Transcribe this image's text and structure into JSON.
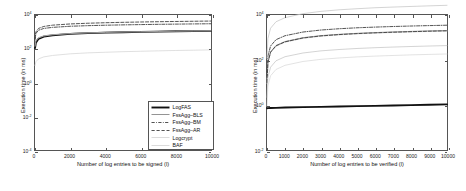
{
  "figure": {
    "panel_count": 2,
    "background": "#ffffff",
    "axis_color": "#555555"
  },
  "chart_data": [
    {
      "type": "line",
      "panel": "left",
      "title": "",
      "xlabel": "Number of log entries to be signed (l)",
      "ylabel": "Execution time (in ms)",
      "yscale": "log",
      "xscale": "linear",
      "xlim": [
        0,
        10000
      ],
      "ylim": [
        0.0001,
        10000
      ],
      "grid": false,
      "legend_position": "lower right",
      "xticks": [
        0,
        2000,
        4000,
        6000,
        8000,
        10000
      ],
      "xticklabels": [
        "0",
        "2000",
        "4000",
        "6000",
        "8000",
        "10000"
      ],
      "yticks": [
        10000,
        100,
        1,
        0.01,
        0.0001
      ],
      "yticklabels": [
        "10^4",
        "10^2",
        "10^0",
        "10^-2",
        "10^-4"
      ],
      "ytick_bases": [
        "10",
        "10",
        "10",
        "10",
        "10"
      ],
      "ytick_exponents": [
        "4",
        "2",
        "0",
        "-2",
        "-4"
      ],
      "x": [
        1,
        50,
        200,
        500,
        1000,
        2000,
        3000,
        4000,
        5000,
        6000,
        7000,
        8000,
        9000,
        10000
      ],
      "series": [
        {
          "name": "LogFAS",
          "style": "thick-solid",
          "color": "#111111",
          "width": 1.9,
          "values": [
            110,
            230,
            390,
            520,
            620,
            760,
            840,
            900,
            950,
            1000,
            1040,
            1080,
            1110,
            1150
          ]
        },
        {
          "name": "FssAgg-BLS",
          "style": "thin-solid",
          "color": "#666666",
          "width": 0.7,
          "values": [
            150,
            300,
            450,
            580,
            680,
            800,
            880,
            940,
            990,
            1030,
            1070,
            1110,
            1140,
            1180
          ]
        },
        {
          "name": "FssAgg-BM",
          "style": "dash-dot",
          "color": "#333333",
          "width": 0.85,
          "values": [
            330,
            800,
            1250,
            1600,
            1850,
            2150,
            2330,
            2480,
            2600,
            2700,
            2800,
            2880,
            2960,
            3030
          ]
        },
        {
          "name": "FssAgg-AR",
          "style": "dashed",
          "color": "#333333",
          "width": 0.85,
          "values": [
            400,
            1000,
            1600,
            2100,
            2500,
            2950,
            3250,
            3480,
            3680,
            3850,
            4000,
            4130,
            4260,
            4380
          ]
        },
        {
          "name": "Logcrypt",
          "style": "light-solid",
          "color": "#d2d2d2",
          "width": 0.7,
          "values": [
            10,
            17,
            25,
            33,
            40,
            50,
            57,
            62,
            67,
            71,
            75,
            79,
            82,
            86
          ]
        },
        {
          "name": "BAF",
          "style": "light-solid",
          "color": "#c8c8c8",
          "width": 0.7,
          "values": [
            140,
            290,
            440,
            570,
            670,
            790,
            870,
            930,
            980,
            1020,
            1060,
            1100,
            1130,
            1170
          ]
        }
      ]
    },
    {
      "type": "line",
      "panel": "right",
      "title": "",
      "xlabel": "Number of log entries to be verified (l)",
      "ylabel": "Execution time (in ms)",
      "yscale": "log",
      "xscale": "linear",
      "xlim": [
        0,
        10000
      ],
      "ylim": [
        0.01,
        10000
      ],
      "grid": false,
      "legend_position": "lower right",
      "xticks": [
        0,
        1000,
        2000,
        3000,
        4000,
        5000,
        6000,
        7000,
        8000,
        9000,
        10000
      ],
      "xticklabels": [
        "0",
        "1000",
        "2000",
        "3000",
        "4000",
        "5000",
        "6000",
        "7000",
        "8000",
        "9000",
        "10000"
      ],
      "yticks": [
        10000,
        100,
        1,
        0.01
      ],
      "yticklabels": [
        "10^4",
        "10^2",
        "10^0",
        "10^-2"
      ],
      "ytick_bases": [
        "10",
        "10",
        "10",
        "10"
      ],
      "ytick_exponents": [
        "4",
        "2",
        "0",
        "-2"
      ],
      "x": [
        1,
        50,
        200,
        500,
        1000,
        2000,
        3000,
        4000,
        5000,
        6000,
        7000,
        8000,
        9000,
        10000
      ],
      "series": [
        {
          "name": "LogFAS",
          "style": "thick-solid",
          "color": "#111111",
          "width": 1.9,
          "values": [
            0.72,
            0.73,
            0.74,
            0.75,
            0.77,
            0.8,
            0.83,
            0.86,
            0.89,
            0.92,
            0.95,
            0.99,
            1.02,
            1.06
          ]
        },
        {
          "name": "FssAgg-BLS",
          "style": "dash-dot",
          "color": "#333333",
          "width": 0.85,
          "values": [
            18,
            150,
            420,
            800,
            1200,
            1750,
            2150,
            2450,
            2700,
            2900,
            3080,
            3240,
            3380,
            3520
          ]
        },
        {
          "name": "FssAgg-BM",
          "style": "thin-solid",
          "color": "#666666",
          "width": 0.7,
          "values": [
            10,
            80,
            230,
            440,
            660,
            980,
            1210,
            1380,
            1530,
            1650,
            1760,
            1860,
            1950,
            2030
          ]
        },
        {
          "name": "FssAgg-AR",
          "style": "light-solid",
          "color": "#cfcfcf",
          "width": 0.7,
          "values": [
            9,
            75,
            215,
            410,
            620,
            920,
            1140,
            1310,
            1450,
            1570,
            1670,
            1770,
            1860,
            1940
          ]
        },
        {
          "name": "Logcrypt",
          "style": "dashed",
          "color": "#333333",
          "width": 0.85,
          "values": [
            10,
            78,
            222,
            425,
            640,
            950,
            1175,
            1345,
            1490,
            1610,
            1715,
            1815,
            1905,
            1985
          ]
        },
        {
          "name": "BAF",
          "style": "light-solid",
          "color": "#c0c0c0",
          "width": 0.7,
          "values": [
            2.2,
            17,
            48,
            92,
            140,
            205,
            255,
            292,
            325,
            352,
            376,
            398,
            418,
            437
          ]
        }
      ],
      "extra_series": [
        {
          "name": "top-light-curve",
          "style": "light-solid",
          "color": "#c9c9c9",
          "width": 0.8,
          "values": [
            120,
            900,
            2600,
            5000,
            7600,
            11500,
            14500,
            17000,
            19000,
            21000,
            22500,
            24000,
            25500,
            27000
          ]
        },
        {
          "name": "low-light-curve",
          "style": "light-solid",
          "color": "#d6d6d6",
          "width": 0.7,
          "values": [
            0.9,
            7,
            20,
            38,
            58,
            86,
            107,
            123,
            137,
            149,
            159,
            169,
            177,
            185
          ]
        }
      ]
    }
  ],
  "legends": {
    "left": {
      "entries": [
        {
          "label": "LogFAS",
          "style": "thick-solid"
        },
        {
          "label": "FssAgg–BLS",
          "style": "thin-solid"
        },
        {
          "label": "FssAgg–BM",
          "style": "dash-dot"
        },
        {
          "label": "FssAgg–AR",
          "style": "dashed"
        },
        {
          "label": "Logcrypt",
          "style": "light-solid"
        },
        {
          "label": "BAF",
          "style": "light-solid"
        }
      ]
    },
    "right": {
      "entries": [
        {
          "label": "LogFAS",
          "style": "thick-solid"
        },
        {
          "label": "FssAgg–BLS",
          "style": "dash-dot"
        },
        {
          "label": "FssAgg–BM",
          "style": "thin-solid"
        },
        {
          "label": "FssAgg–AR",
          "style": "light-solid"
        },
        {
          "label": "Logcrypt",
          "style": "dashed"
        },
        {
          "label": "BAF",
          "style": "light-solid"
        }
      ]
    }
  }
}
